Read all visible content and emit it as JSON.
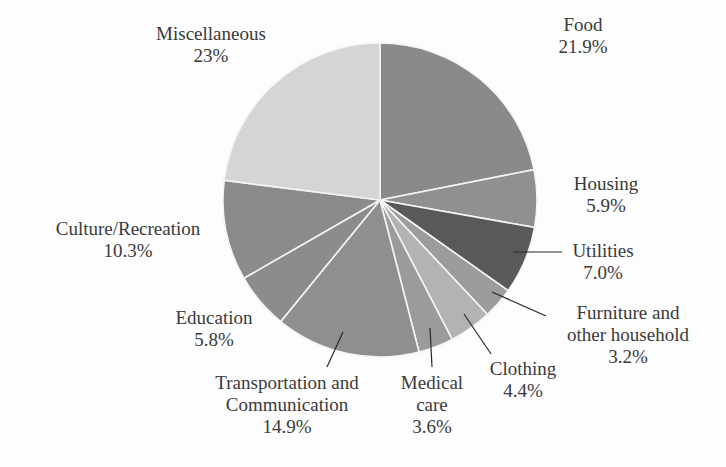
{
  "chart_data": {
    "type": "pie",
    "title": "",
    "start_angle_deg": 0,
    "direction": "clockwise",
    "center": [
      380,
      200
    ],
    "radius": 157,
    "unit": "%",
    "slices": [
      {
        "label": "Food",
        "label_lines": [
          "Food"
        ],
        "value": 21.9,
        "display": "21.9%",
        "color": "#8a8a8a",
        "label_pos": [
          583,
          14
        ],
        "leader": null
      },
      {
        "label": "Housing",
        "label_lines": [
          "Housing"
        ],
        "value": 5.9,
        "display": "5.9%",
        "color": "#909090",
        "label_pos": [
          606,
          173
        ],
        "leader": null
      },
      {
        "label": "Utilities",
        "label_lines": [
          "Utilities"
        ],
        "value": 7.0,
        "display": "7.0%",
        "color": "#595959",
        "label_pos": [
          603,
          240
        ],
        "leader": [
          [
            513,
            252
          ],
          [
            562,
            252
          ]
        ]
      },
      {
        "label": "Furniture and other household",
        "label_lines": [
          "Furniture and",
          "other household"
        ],
        "value": 3.2,
        "display": "3.2%",
        "color": "#9c9c9c",
        "label_pos": [
          628,
          302
        ],
        "leader": [
          [
            492,
            292
          ],
          [
            546,
            316
          ]
        ]
      },
      {
        "label": "Clothing",
        "label_lines": [
          "Clothing"
        ],
        "value": 4.4,
        "display": "4.4%",
        "color": "#b3b3b3",
        "label_pos": [
          523,
          358
        ],
        "leader": [
          [
            464,
            314
          ],
          [
            491,
            354
          ]
        ]
      },
      {
        "label": "Medical care",
        "label_lines": [
          "Medical",
          "care"
        ],
        "value": 3.6,
        "display": "3.6%",
        "color": "#9b9b9b",
        "label_pos": [
          432,
          372
        ],
        "leader": [
          [
            430,
            328
          ],
          [
            432,
            367
          ]
        ]
      },
      {
        "label": "Transportation and Communication",
        "label_lines": [
          "Transportation and",
          "Communication"
        ],
        "value": 14.9,
        "display": "14.9%",
        "color": "#8f8f8f",
        "label_pos": [
          287,
          372
        ],
        "leader": [
          [
            343,
            332
          ],
          [
            327,
            367
          ]
        ]
      },
      {
        "label": "Education",
        "label_lines": [
          "Education"
        ],
        "value": 5.8,
        "display": "5.8%",
        "color": "#8c8c8c",
        "label_pos": [
          214,
          307
        ],
        "leader": null
      },
      {
        "label": "Culture/Recreation",
        "label_lines": [
          "Culture/Recreation"
        ],
        "value": 10.3,
        "display": "10.3%",
        "color": "#8b8b8b",
        "label_pos": [
          128,
          218
        ],
        "leader": null
      },
      {
        "label": "Miscellaneous",
        "label_lines": [
          "Miscellaneous"
        ],
        "value": 23,
        "display": "23%",
        "color": "#d5d5d5",
        "label_pos": [
          211,
          23
        ],
        "leader": null
      }
    ],
    "legend": "none (direct labels)",
    "grid": false
  }
}
